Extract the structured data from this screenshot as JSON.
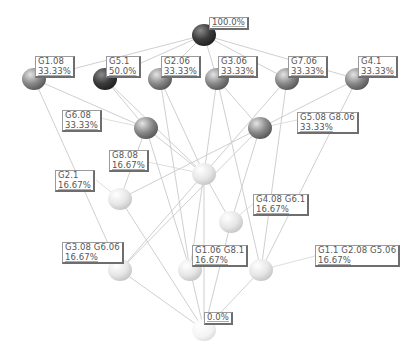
{
  "diagram": {
    "type": "concept-lattice",
    "nodes": [
      {
        "id": "top",
        "x": 204,
        "y": 35,
        "shade": "dark",
        "name": "",
        "pct": "100.0%",
        "label_x": 209,
        "label_y": 17
      },
      {
        "id": "g108",
        "x": 34,
        "y": 79,
        "shade": "mid",
        "name": "G1.08",
        "pct": "33.33%",
        "label_x": 35,
        "label_y": 56
      },
      {
        "id": "g51",
        "x": 105,
        "y": 79,
        "shade": "dark",
        "name": "G5.1",
        "pct": "50.0%",
        "label_x": 106,
        "label_y": 56
      },
      {
        "id": "g206",
        "x": 160,
        "y": 79,
        "shade": "mid",
        "name": "G2.06",
        "pct": "33.33%",
        "label_x": 161,
        "label_y": 56
      },
      {
        "id": "g306",
        "x": 217,
        "y": 79,
        "shade": "mid",
        "name": "G3.06",
        "pct": "33.33%",
        "label_x": 218,
        "label_y": 56
      },
      {
        "id": "g706",
        "x": 287,
        "y": 79,
        "shade": "mid",
        "name": "G7.06",
        "pct": "33.33%",
        "label_x": 288,
        "label_y": 56
      },
      {
        "id": "g41",
        "x": 357,
        "y": 79,
        "shade": "mid",
        "name": "G4.1",
        "pct": "33.33%",
        "label_x": 358,
        "label_y": 56
      },
      {
        "id": "g608",
        "x": 146,
        "y": 128,
        "shade": "mid",
        "name": "G6.08",
        "pct": "33.33%",
        "label_x": 62,
        "label_y": 110
      },
      {
        "id": "g508g806",
        "x": 260,
        "y": 128,
        "shade": "mid",
        "name": "G5.08 G8.06",
        "pct": "33.33%",
        "label_x": 297,
        "label_y": 112
      },
      {
        "id": "g808",
        "x": 204,
        "y": 174,
        "shade": "light",
        "name": "G8.08",
        "pct": "16.67%",
        "label_x": 109,
        "label_y": 150
      },
      {
        "id": "g21",
        "x": 120,
        "y": 199,
        "shade": "light",
        "name": "G2.1",
        "pct": "16.67%",
        "label_x": 55,
        "label_y": 170
      },
      {
        "id": "g408g61",
        "x": 231,
        "y": 222,
        "shade": "light",
        "name": "G4.08 G6.1",
        "pct": "16.67%",
        "label_x": 253,
        "label_y": 194
      },
      {
        "id": "g308g606",
        "x": 120,
        "y": 270,
        "shade": "light",
        "name": "G3.08 G6.06",
        "pct": "16.67%",
        "label_x": 62,
        "label_y": 242
      },
      {
        "id": "g106g81",
        "x": 190,
        "y": 270,
        "shade": "light",
        "name": "G1.06 G8.1",
        "pct": "16.67%",
        "label_x": 192,
        "label_y": 245
      },
      {
        "id": "g11g208g506",
        "x": 261,
        "y": 270,
        "shade": "light",
        "name": "G1.1 G2.08 G5.06",
        "pct": "16.67%",
        "label_x": 315,
        "label_y": 245
      },
      {
        "id": "bottom",
        "x": 204,
        "y": 330,
        "shade": "faint",
        "name": "",
        "pct": "0.0%",
        "label_x": 204,
        "label_y": 312
      }
    ],
    "edges": [
      [
        "top",
        "g108"
      ],
      [
        "top",
        "g51"
      ],
      [
        "top",
        "g206"
      ],
      [
        "top",
        "g306"
      ],
      [
        "top",
        "g706"
      ],
      [
        "top",
        "g41"
      ],
      [
        "g108",
        "g608"
      ],
      [
        "g108",
        "g308g606"
      ],
      [
        "g51",
        "g608"
      ],
      [
        "g51",
        "g808"
      ],
      [
        "g206",
        "g106g81"
      ],
      [
        "g206",
        "g808"
      ],
      [
        "g306",
        "g808"
      ],
      [
        "g306",
        "g11g208g506"
      ],
      [
        "g306",
        "g508g806"
      ],
      [
        "g706",
        "g308g606"
      ],
      [
        "g706",
        "g11g208g506"
      ],
      [
        "g41",
        "g21"
      ],
      [
        "g41",
        "g11g208g506"
      ],
      [
        "g608",
        "g808"
      ],
      [
        "g608",
        "g106g81"
      ],
      [
        "g608",
        "g21"
      ],
      [
        "g508g806",
        "g408g61"
      ],
      [
        "g508g806",
        "g308g606"
      ],
      [
        "g808",
        "g408g61"
      ],
      [
        "g808",
        "g106g81"
      ],
      [
        "g808",
        "bottom"
      ],
      [
        "g21",
        "bottom"
      ],
      [
        "g408g61",
        "bottom"
      ],
      [
        "g308g606",
        "bottom"
      ],
      [
        "g106g81",
        "bottom"
      ],
      [
        "g11g208g506",
        "bottom"
      ]
    ],
    "leaders": [
      [
        "g608",
        100,
        118
      ],
      [
        "g508g806",
        297,
        120
      ],
      [
        "g808",
        148,
        162
      ],
      [
        "g21",
        96,
        180
      ],
      [
        "g408g61",
        253,
        204
      ],
      [
        "g308g606",
        120,
        256
      ],
      [
        "g106g81",
        192,
        256
      ],
      [
        "g11g208g506",
        315,
        256
      ]
    ],
    "colors": {
      "edge": "#c9c9c9",
      "leader": "#d4d4d4",
      "dark": "#3f3f3f",
      "mid": "#8a8a8a",
      "light": "#e3e3e3",
      "faint": "#f0f0f0"
    }
  }
}
